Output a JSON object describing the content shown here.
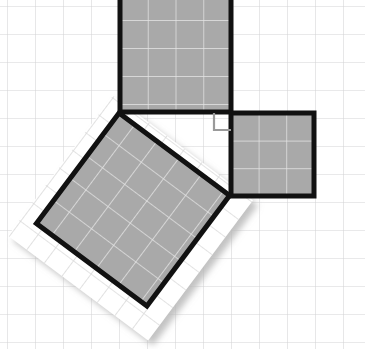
{
  "figure": {
    "canvas": {
      "width": 365,
      "height": 349
    },
    "background": {
      "name": "graph-paper",
      "paper_color": "#ffffff",
      "grid_line_color": "#d2d2d4",
      "grid_spacing": 28,
      "grid_offset_x": 7,
      "grid_offset_y": 6,
      "grid_visible": true
    },
    "style": {
      "square_fill": "#a9a9a9",
      "square_outline": "#111111",
      "square_outline_width": 5,
      "inner_grid_color": "#e8e8e8",
      "right_angle_marker_color": "#9a9a9a",
      "tilted_sheet_fill": "#ffffff",
      "tilted_sheet_grid_color": "#dcdcdc",
      "shadow_color": "#c9c9c9"
    },
    "triangle": {
      "name": "right-triangle",
      "legs": [
        4,
        3
      ],
      "hypotenuse": 5,
      "right_angle_vertex": [
        231,
        113
      ],
      "vertices": [
        [
          231,
          113
        ],
        [
          117,
          113
        ],
        [
          228,
          196
        ]
      ],
      "right_angle_marker_size": 16
    },
    "squares": [
      {
        "id": "square-on-vertical-leg",
        "label": "top square",
        "side_cells": 4,
        "area_cells": 16,
        "orientation": "axis-aligned",
        "x": 120,
        "y": -8,
        "width": 111,
        "height": 120,
        "rows": 4,
        "cols": 4,
        "fill": "#a9a9a9"
      },
      {
        "id": "square-on-horizontal-leg",
        "label": "right square",
        "side_cells": 3,
        "area_cells": 9,
        "orientation": "axis-aligned",
        "x": 231,
        "y": 113,
        "width": 83,
        "height": 83,
        "rows": 3,
        "cols": 3,
        "fill": "#a9a9a9"
      },
      {
        "id": "square-on-hypotenuse",
        "label": "tilted square",
        "side_cells": 5,
        "area_cells": 25,
        "orientation": "rotated",
        "vertices": [
          [
            117,
            113
          ],
          [
            228,
            196
          ],
          [
            148,
            306
          ],
          [
            38,
            222
          ]
        ],
        "rows": 5,
        "cols": 5,
        "fill": "#a9a9a9"
      }
    ],
    "tilted_sheet": {
      "id": "tilted-grid-sheet",
      "label": "rotated sheet of grid paper behind hypotenuse square",
      "vertices": [
        [
          103,
          99
        ],
        [
          243,
          204
        ],
        [
          162,
          337
        ],
        [
          18,
          231
        ]
      ],
      "rotation_deg": 36.8,
      "grid_spacing": 22,
      "fill": "#ffffff",
      "grid_color": "#dcdcdc",
      "has_drop_shadow": true
    }
  }
}
